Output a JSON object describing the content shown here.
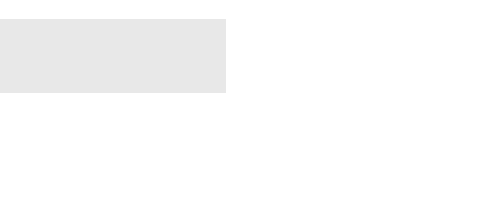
{
  "page_number": "429",
  "figure_label": "FIGURE 10-2",
  "left_diagram": {
    "eq_pc": "P_C = P_ave",
    "eq_p": "P = P₀ + ρgy sin θ",
    "eq_h": "h = y sin θ",
    "eq_fr": "F_R = P_C A",
    "origin": "O",
    "theta": "θ",
    "y_axis": "y",
    "y_dim": "y",
    "yc_dim": "y_C",
    "x_axis": "x",
    "dA": "dA",
    "C": "C",
    "CP": "CP",
    "A": "A",
    "centroid": "Centroid",
    "center_of_pressure": "Center of pressure",
    "plane_surface_1": "Plane surface",
    "plane_surface_2": "of area A"
  },
  "right_diagram": {
    "pressure_distribution_1": "Pressure",
    "pressure_distribution_2": "distribution",
    "prism_1": "Pressure prism",
    "prism_2": "of volume V",
    "eq_p": "P = P₀ + ρgh",
    "plane_surface": "Plane surface",
    "dA": "dA",
    "eq_volume": "V = ∫dV = ∫P dA = F_R"
  },
  "colors": {
    "panel_gray": "#e6e6e6",
    "surface_gray": "#bdbdbd",
    "line": "#333333"
  }
}
